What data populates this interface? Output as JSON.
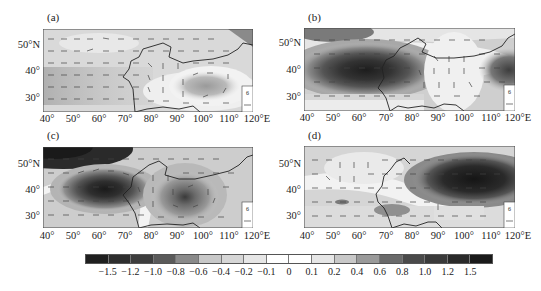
{
  "chart_data": [
    {
      "type": "heatmap",
      "panel": "(a)",
      "title": "(a)",
      "description": "Shaded anomaly field with wind vectors over 40°E–120°E, 25°N–55°N",
      "xlabel": "",
      "ylabel": "",
      "x_ticks": [
        "40°",
        "50°",
        "60°",
        "70°",
        "80°",
        "90°",
        "100°",
        "110°",
        "120°E"
      ],
      "y_ticks": [
        "50°N",
        "40°",
        "30°"
      ],
      "xlim": [
        40,
        120
      ],
      "ylim": [
        25,
        55
      ],
      "features": [
        {
          "type": "cyclonic-circulation",
          "center_lon": 105,
          "center_lat": 35,
          "value": -0.4
        },
        {
          "type": "negative-band",
          "lon_range": [
            40,
            80
          ],
          "lat_range": [
            28,
            40
          ],
          "value": -0.3
        },
        {
          "type": "positive-anomaly",
          "lon_range": [
            112,
            120
          ],
          "lat_range": [
            52,
            55
          ],
          "value": 0.6
        }
      ],
      "reference_vector": "6"
    },
    {
      "type": "heatmap",
      "panel": "(b)",
      "title": "(b)",
      "x_ticks": [
        "40°",
        "50°",
        "60°",
        "70°",
        "80°",
        "90°",
        "100°",
        "110°",
        "120°E"
      ],
      "y_ticks": [
        "50°N",
        "40°",
        "30°"
      ],
      "xlim": [
        40,
        120
      ],
      "ylim": [
        25,
        55
      ],
      "features": [
        {
          "type": "strong-anomaly-core",
          "center_lon": 65,
          "center_lat": 40,
          "value": 1.5
        },
        {
          "type": "anomaly",
          "center_lon": 118,
          "center_lat": 37,
          "value": 1.0
        },
        {
          "type": "anomaly",
          "lon_range": [
            40,
            50
          ],
          "lat_range": [
            50,
            55
          ],
          "value": 0.8
        }
      ],
      "reference_vector": "6"
    },
    {
      "type": "heatmap",
      "panel": "(c)",
      "title": "(c)",
      "x_ticks": [
        "40°",
        "50°",
        "60°",
        "70°",
        "80°",
        "90°",
        "100°",
        "110°",
        "120°E"
      ],
      "y_ticks": [
        "50°N",
        "40°",
        "30°"
      ],
      "xlim": [
        40,
        120
      ],
      "ylim": [
        25,
        55
      ],
      "features": [
        {
          "type": "strong-anomaly-core",
          "center_lon": 64,
          "center_lat": 38,
          "value": 1.5
        },
        {
          "type": "anomaly-core",
          "center_lon": 95,
          "center_lat": 35,
          "value": 1.0
        },
        {
          "type": "anomaly",
          "lon_range": [
            40,
            60
          ],
          "lat_range": [
            50,
            55
          ],
          "value": 1.5
        }
      ],
      "reference_vector": "6"
    },
    {
      "type": "heatmap",
      "panel": "(d)",
      "title": "(d)",
      "x_ticks": [
        "40°",
        "50°",
        "60°",
        "70°",
        "80°",
        "90°",
        "100°",
        "110°",
        "120°E"
      ],
      "y_ticks": [
        "50°N",
        "40°",
        "30°"
      ],
      "xlim": [
        40,
        120
      ],
      "ylim": [
        25,
        55
      ],
      "features": [
        {
          "type": "strong-anomaly-core",
          "center_lon": 108,
          "center_lat": 47,
          "value": 1.5
        },
        {
          "type": "anomaly",
          "center_lon": 85,
          "center_lat": 31,
          "value": 0.6
        },
        {
          "type": "small-anomaly",
          "center_lon": 51,
          "center_lat": 35,
          "value": 0.6
        }
      ],
      "reference_vector": "6"
    }
  ],
  "panels": {
    "a": {
      "label": "(a)",
      "ref": "6"
    },
    "b": {
      "label": "(b)",
      "ref": "6"
    },
    "c": {
      "label": "(c)",
      "ref": "6"
    },
    "d": {
      "label": "(d)",
      "ref": "6"
    }
  },
  "axes": {
    "y_ticks": [
      "50°N",
      "40°",
      "30°"
    ],
    "x_ticks": [
      "40°",
      "50°",
      "60°",
      "70°",
      "80°",
      "90°",
      "100°",
      "110°",
      "120°E"
    ]
  },
  "colorbar": {
    "labels": [
      "−1.5",
      "−1.2",
      "−1.0",
      "−0.8",
      "−0.6",
      "−0.4",
      "−0.2",
      "−0.1",
      "0",
      "0.1",
      "0.2",
      "0.4",
      "0.6",
      "0.8",
      "1.0",
      "1.2",
      "1.5"
    ],
    "colors": [
      "#1f1f1f",
      "#2e2e2e",
      "#3d3d3d",
      "#5a5a5a",
      "#8a8a8a",
      "#c8c8c8",
      "#d6d6d6",
      "#e6e6e6",
      "#ffffff",
      "#ffffff",
      "#e6e6e6",
      "#c8c8c8",
      "#9a9a9a",
      "#6a6a6a",
      "#4a4a4a",
      "#3a3a3a",
      "#2a2a2a",
      "#1a1a1a"
    ]
  }
}
